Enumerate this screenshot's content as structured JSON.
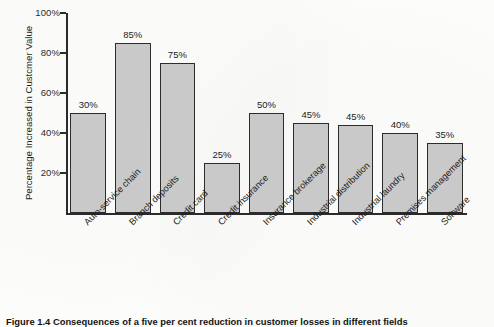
{
  "figure": {
    "caption": "Figure 1.4 Consequences of a five per cent reduction in customer losses in different fields"
  },
  "chart_data": {
    "type": "bar",
    "title": "",
    "xlabel": "",
    "ylabel": "Percentage Increased in Custcmer Value",
    "ylim": [
      0,
      100
    ],
    "grid": false,
    "legend": false,
    "y_tick_labels": [
      "100%",
      "80%",
      "60%",
      "40%",
      "20%"
    ],
    "y_tick_values": [
      100,
      80,
      60,
      40,
      20
    ],
    "categories": [
      "Auto-service chain",
      "Branch deposits",
      "Credit card",
      "Credit insurance",
      "Insurance brokerage",
      "Industrial distribution",
      "Industrial laundry",
      "Premises management",
      "Software"
    ],
    "data_labels": [
      "30%",
      "85%",
      "75%",
      "25%",
      "50%",
      "45%",
      "45%",
      "40%",
      "35%"
    ],
    "values": [
      50,
      85,
      75,
      25,
      50,
      45,
      44,
      40,
      35
    ],
    "bar_color": "#c9c9c9",
    "bar_edge_color": "#2c2c2c",
    "axis_color": "#2b2b2b"
  }
}
